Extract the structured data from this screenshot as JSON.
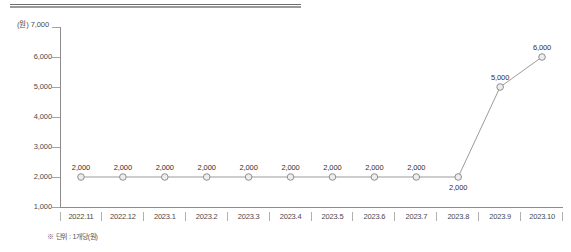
{
  "chart_data": {
    "type": "line",
    "title": "",
    "subtitle": "",
    "xlabel": "",
    "ylabel": "",
    "y_unit_label": "(원) 7,000",
    "y_unit": "(원)",
    "categories": [
      "2022.11",
      "2022.12",
      "2023.1",
      "2023.2",
      "2023.3",
      "2023.4",
      "2023.5",
      "2023.6",
      "2023.7",
      "2023.8",
      "2023.9",
      "2023.10"
    ],
    "values": [
      2000,
      2000,
      2000,
      2000,
      2000,
      2000,
      2000,
      2000,
      2000,
      2000,
      5000,
      6000
    ],
    "point_labels": [
      "2,000",
      "2,000",
      "2,000",
      "2,000",
      "2,000",
      "2,000",
      "2,000",
      "2,000",
      "2,000",
      "2,000",
      "5,000",
      "6,000"
    ],
    "point_label_positions": [
      "above",
      "above",
      "above",
      "above",
      "above",
      "above",
      "above",
      "above",
      "above",
      "below",
      "above",
      "above"
    ],
    "ylim": [
      1000,
      7000
    ],
    "yticks": [
      7000,
      6000,
      5000,
      4000,
      3000,
      2000,
      1000
    ],
    "ytick_labels": [
      "7,000",
      "6,000",
      "5,000",
      "4,000",
      "3,000",
      "2,000",
      "1,000"
    ],
    "grid": false,
    "legend": null,
    "series_color": "#9b9b9b",
    "marker_fill": "#ededed",
    "marker_stroke": "#8f8f8f",
    "axis_color": "#8c8c8c"
  },
  "footnote": "※ 단위 : 1개당(원)"
}
